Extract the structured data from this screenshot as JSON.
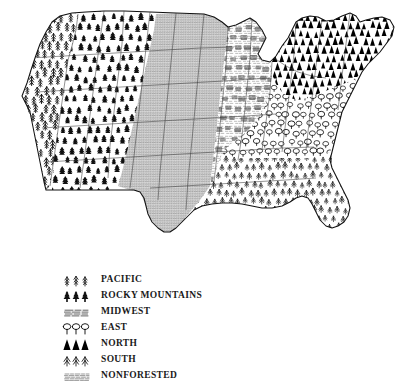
{
  "figure": {
    "kind": "thematic-map",
    "map_name": "us-forest-regions-map"
  },
  "legend": {
    "name": "forest-region-legend",
    "entries": [
      {
        "label": "PACIFIC",
        "symbol": "tall-conifer-icon",
        "ink": "#111111"
      },
      {
        "label": "ROCKY MOUNTAINS",
        "symbol": "bushy-conifer-icon",
        "ink": "#111111"
      },
      {
        "label": "MIDWEST",
        "symbol": "hatch-scrub-icon",
        "ink": "#3a3a3a"
      },
      {
        "label": "EAST",
        "symbol": "broadleaf-tree-icon",
        "ink": "#111111"
      },
      {
        "label": "NORTH",
        "symbol": "solid-triangle-fir-icon",
        "ink": "#000000"
      },
      {
        "label": "SOUTH",
        "symbol": "pine-m-icon",
        "ink": "#111111"
      },
      {
        "label": "NONFORESTED",
        "symbol": "fine-stipple-icon",
        "ink": "#555555"
      }
    ]
  },
  "map": {
    "regions": [
      {
        "name": "PACIFIC",
        "symbol": "tall-conifer-icon"
      },
      {
        "name": "ROCKY MOUNTAINS",
        "symbol": "bushy-conifer-icon"
      },
      {
        "name": "MIDWEST",
        "symbol": "hatch-scrub-icon"
      },
      {
        "name": "EAST",
        "symbol": "broadleaf-tree-icon"
      },
      {
        "name": "NORTH",
        "symbol": "solid-triangle-fir-icon"
      },
      {
        "name": "SOUTH",
        "symbol": "pine-m-icon"
      },
      {
        "name": "NONFORESTED",
        "symbol": "fine-stipple-icon"
      }
    ],
    "colors": {
      "ink": "#000000",
      "paper": "#ffffff",
      "stipple": "#4a4a4a"
    }
  }
}
